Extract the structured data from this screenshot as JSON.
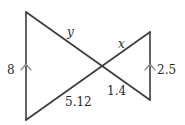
{
  "figure": {
    "type": "bowtie-similar-triangles",
    "colors": {
      "edge": "#3a3a3a",
      "arrow": "#8a8a8a",
      "text": "#2a2a2a"
    },
    "vertices": {
      "left_top": [
        26,
        12
      ],
      "left_bottom": [
        26,
        120
      ],
      "right_top": [
        150,
        32
      ],
      "right_bottom": [
        150,
        100
      ],
      "crossing": [
        102,
        66
      ]
    },
    "labels": {
      "left_side": "8",
      "upper_left_segment": "y",
      "upper_right_segment": "x",
      "lower_left_segment": "5.12",
      "lower_right_segment": "1.4",
      "right_side": "2.5"
    },
    "parallel_marks": [
      "left-side-arrow",
      "right-side-arrow"
    ]
  }
}
